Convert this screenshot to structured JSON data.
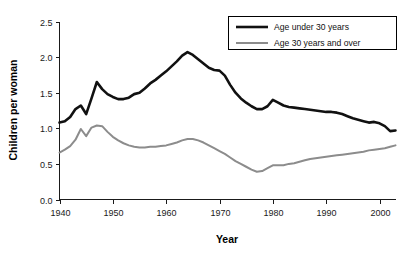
{
  "chart_data": {
    "type": "line",
    "title": "",
    "xlabel": "Year",
    "ylabel": "Children per woman",
    "xlim": [
      1940,
      2003
    ],
    "ylim": [
      0.0,
      2.5
    ],
    "xticks": [
      1940,
      1950,
      1960,
      1970,
      1980,
      1990,
      2000
    ],
    "yticks": [
      "0.0",
      "0.5",
      "1.0",
      "1.5",
      "2.0",
      "2.5"
    ],
    "grid": false,
    "legend_position": "top-right",
    "colors": {
      "series_under_30": "#111111",
      "series_30_and_over": "#8c8c8c",
      "axis": "#1a1a1a",
      "background": "#ffffff"
    },
    "x": [
      1940,
      1941,
      1942,
      1943,
      1944,
      1945,
      1946,
      1947,
      1948,
      1949,
      1950,
      1951,
      1952,
      1953,
      1954,
      1955,
      1956,
      1957,
      1958,
      1959,
      1960,
      1961,
      1962,
      1963,
      1964,
      1965,
      1966,
      1967,
      1968,
      1969,
      1970,
      1971,
      1972,
      1973,
      1974,
      1975,
      1976,
      1977,
      1978,
      1979,
      1980,
      1981,
      1982,
      1983,
      1984,
      1985,
      1986,
      1987,
      1988,
      1989,
      1990,
      1991,
      1992,
      1993,
      1994,
      1995,
      1996,
      1997,
      1998,
      1999,
      2000,
      2001,
      2002,
      2003
    ],
    "series": [
      {
        "name": "Age under 30 years",
        "color": "#111111",
        "line_width": 2.6,
        "values": [
          1.08,
          1.1,
          1.16,
          1.27,
          1.32,
          1.2,
          1.42,
          1.65,
          1.55,
          1.48,
          1.44,
          1.41,
          1.41,
          1.43,
          1.48,
          1.5,
          1.56,
          1.63,
          1.68,
          1.74,
          1.8,
          1.87,
          1.94,
          2.02,
          2.07,
          2.03,
          1.97,
          1.91,
          1.85,
          1.82,
          1.81,
          1.74,
          1.61,
          1.5,
          1.42,
          1.36,
          1.31,
          1.27,
          1.27,
          1.31,
          1.4,
          1.36,
          1.32,
          1.3,
          1.29,
          1.28,
          1.27,
          1.26,
          1.25,
          1.24,
          1.23,
          1.23,
          1.22,
          1.2,
          1.17,
          1.14,
          1.12,
          1.1,
          1.08,
          1.09,
          1.07,
          1.03,
          0.96,
          0.97
        ]
      },
      {
        "name": "Age 30 years and over",
        "color": "#8c8c8c",
        "line_width": 2.0,
        "values": [
          0.66,
          0.7,
          0.75,
          0.84,
          0.99,
          0.89,
          1.01,
          1.04,
          1.03,
          0.95,
          0.88,
          0.83,
          0.79,
          0.76,
          0.74,
          0.73,
          0.73,
          0.74,
          0.74,
          0.75,
          0.76,
          0.78,
          0.8,
          0.83,
          0.85,
          0.85,
          0.83,
          0.8,
          0.76,
          0.72,
          0.68,
          0.64,
          0.59,
          0.54,
          0.5,
          0.46,
          0.42,
          0.39,
          0.4,
          0.44,
          0.48,
          0.48,
          0.48,
          0.5,
          0.51,
          0.53,
          0.55,
          0.57,
          0.58,
          0.59,
          0.6,
          0.61,
          0.62,
          0.63,
          0.64,
          0.65,
          0.66,
          0.67,
          0.69,
          0.7,
          0.71,
          0.72,
          0.74,
          0.76
        ]
      }
    ],
    "legend": [
      {
        "label": "Age under 30 years",
        "color": "#111111",
        "line_width": 2.6
      },
      {
        "label": "Age 30 years and over",
        "color": "#8c8c8c",
        "line_width": 2.0
      }
    ]
  }
}
